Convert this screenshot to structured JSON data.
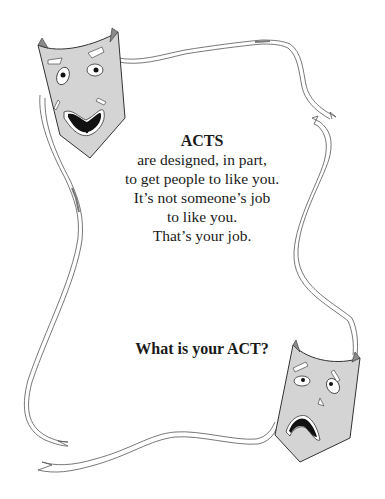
{
  "poster": {
    "title": "ACTS",
    "lines": [
      "are designed, in part,",
      "to get people to like you.",
      "It’s not someone’s job",
      "to like you.",
      "That’s your job."
    ],
    "question": "What is your ACT?"
  },
  "illustration": {
    "masks": [
      {
        "name": "comedy-mask",
        "expression": "grimacing smile"
      },
      {
        "name": "tragedy-mask",
        "expression": "frown with tear"
      }
    ],
    "mask_fill": "#d4d4d4",
    "mask_shadow": "#8a8a8a",
    "line_color": "#555555",
    "ribbon": "ribbon-frame"
  }
}
